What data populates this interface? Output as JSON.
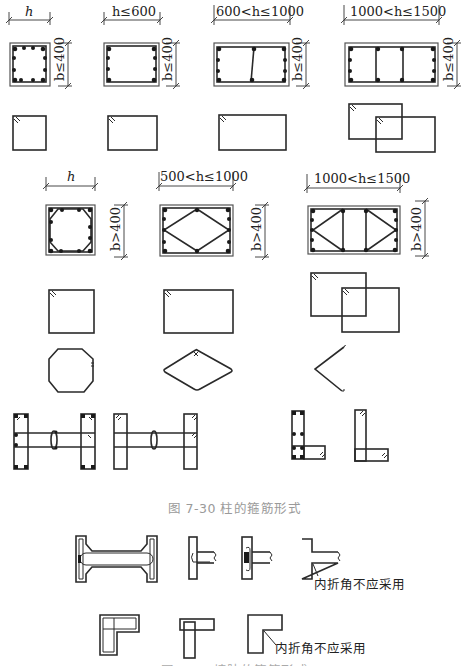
{
  "figure": {
    "caption_main": "图 7-30   柱的箍筋形式",
    "caption_bottom_partial": "图 7-31   墙肢的箍筋形式"
  },
  "row1": {
    "dims": [
      {
        "h": "h",
        "b": "b≤400"
      },
      {
        "h": "h≤600",
        "b": "b≤400"
      },
      {
        "h": "600<h≤1000",
        "b": "b≤400"
      },
      {
        "h": "1000<h≤1500",
        "b": "b≤400"
      }
    ]
  },
  "row2": {
    "dims": [
      {
        "h": "h",
        "b": "b>400"
      },
      {
        "h": "500<h≤1000",
        "b": "b>400"
      },
      {
        "h": "1000<h≤1500",
        "b": "b>400"
      }
    ]
  },
  "notes": {
    "inner_corner_1": "内折角不应采用",
    "inner_corner_2": "内折角不应采用"
  },
  "colors": {
    "line": "#2a2a2a",
    "caption": "#9a9a9a",
    "background": "#ffffff"
  }
}
